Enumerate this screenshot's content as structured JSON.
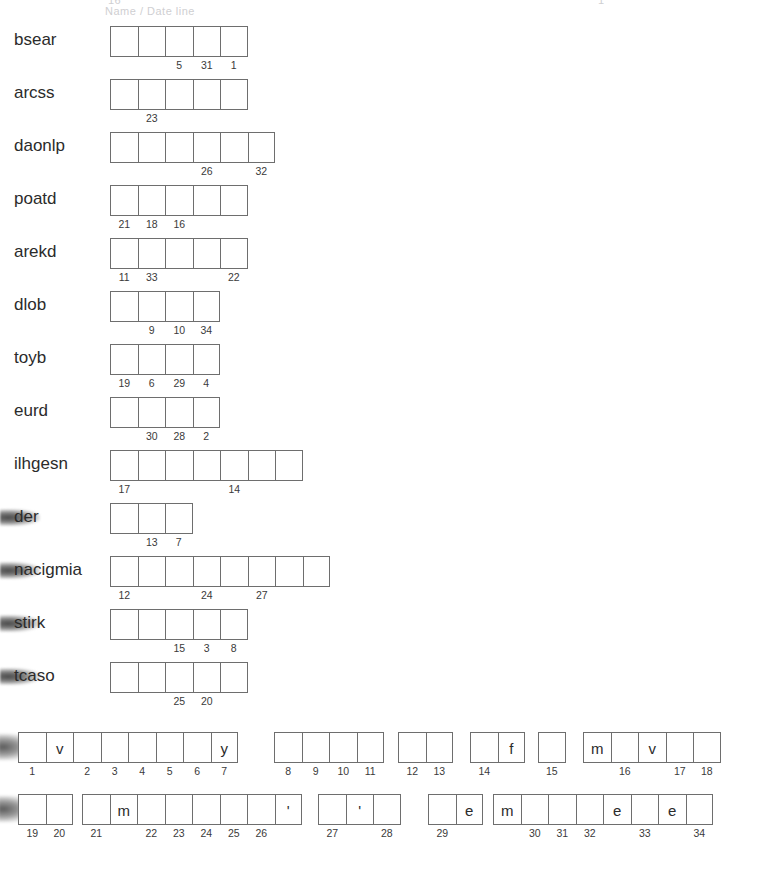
{
  "page": {
    "title_ghost_left": "16",
    "title_ghost_right": "1",
    "title_ghost_sub": "Name / Date line"
  },
  "scramble": {
    "rows": [
      {
        "label": "bsear",
        "cells": 5,
        "numbers": {
          "2": "5",
          "3": "31",
          "4": "1"
        }
      },
      {
        "label": "arcss",
        "cells": 5,
        "numbers": {
          "1": "23"
        }
      },
      {
        "label": "daonlp",
        "cells": 6,
        "numbers": {
          "3": "26",
          "5": "32"
        }
      },
      {
        "label": "poatd",
        "cells": 5,
        "numbers": {
          "0": "21",
          "1": "18",
          "2": "16"
        }
      },
      {
        "label": "arekd",
        "cells": 5,
        "numbers": {
          "0": "11",
          "1": "33",
          "4": "22"
        }
      },
      {
        "label": "dlob",
        "cells": 4,
        "numbers": {
          "1": "9",
          "2": "10",
          "3": "34"
        }
      },
      {
        "label": "toyb",
        "cells": 4,
        "numbers": {
          "0": "19",
          "1": "6",
          "2": "29",
          "3": "4"
        }
      },
      {
        "label": "eurd",
        "cells": 4,
        "numbers": {
          "1": "30",
          "2": "28",
          "3": "2"
        }
      },
      {
        "label": "ilhgesn",
        "cells": 7,
        "numbers": {
          "0": "17",
          "4": "14"
        }
      },
      {
        "label": "der",
        "cells": 3,
        "numbers": {
          "1": "13",
          "2": "7"
        },
        "smudge": true
      },
      {
        "label": "nacigmia",
        "cells": 8,
        "numbers": {
          "0": "12",
          "3": "24",
          "5": "27"
        },
        "smudge": true
      },
      {
        "label": "stirk",
        "cells": 5,
        "numbers": {
          "2": "15",
          "3": "3",
          "4": "8"
        },
        "smudge": true
      },
      {
        "label": "tcaso",
        "cells": 5,
        "numbers": {
          "2": "25",
          "3": "20"
        },
        "smudge": true
      }
    ]
  },
  "cryptogram": {
    "rows": [
      {
        "smudge": true,
        "words": [
          {
            "left": 18,
            "cells": [
              {
                "letter": "",
                "num": "1"
              },
              {
                "letter": "v",
                "num": ""
              },
              {
                "letter": "",
                "num": "2"
              },
              {
                "letter": "",
                "num": "3"
              },
              {
                "letter": "",
                "num": "4"
              },
              {
                "letter": "",
                "num": "5"
              },
              {
                "letter": "",
                "num": "6"
              },
              {
                "letter": "y",
                "num": "7"
              }
            ]
          },
          {
            "left": 274,
            "cells": [
              {
                "letter": "",
                "num": "8"
              },
              {
                "letter": "",
                "num": "9"
              },
              {
                "letter": "",
                "num": "10"
              },
              {
                "letter": "",
                "num": "11"
              }
            ]
          },
          {
            "left": 398,
            "cells": [
              {
                "letter": "",
                "num": "12"
              },
              {
                "letter": "",
                "num": "13"
              }
            ]
          },
          {
            "left": 470,
            "cells": [
              {
                "letter": "",
                "num": "14"
              },
              {
                "letter": "f",
                "num": ""
              }
            ]
          },
          {
            "left": 538,
            "cells": [
              {
                "letter": "",
                "num": "15"
              }
            ]
          },
          {
            "left": 583,
            "cells": [
              {
                "letter": "m",
                "num": ""
              },
              {
                "letter": "",
                "num": "16"
              },
              {
                "letter": "v",
                "num": ""
              },
              {
                "letter": "",
                "num": "17"
              },
              {
                "letter": "",
                "num": "18"
              }
            ]
          }
        ]
      },
      {
        "smudge": true,
        "words": [
          {
            "left": 18,
            "cells": [
              {
                "letter": "",
                "num": "19"
              },
              {
                "letter": "",
                "num": "20"
              }
            ]
          },
          {
            "left": 82,
            "cells": [
              {
                "letter": "",
                "num": "21"
              },
              {
                "letter": "m",
                "num": ""
              },
              {
                "letter": "",
                "num": "22"
              },
              {
                "letter": "",
                "num": "23"
              },
              {
                "letter": "",
                "num": "24"
              },
              {
                "letter": "",
                "num": "25"
              },
              {
                "letter": "",
                "num": "26"
              },
              {
                "letter": "'",
                "num": ""
              }
            ]
          },
          {
            "left": 318,
            "cells": [
              {
                "letter": "",
                "num": "27"
              },
              {
                "letter": "'",
                "num": ""
              },
              {
                "letter": "",
                "num": "28"
              }
            ]
          },
          {
            "left": 428,
            "cells": [
              {
                "letter": "",
                "num": "29"
              },
              {
                "letter": "e",
                "num": ""
              }
            ]
          },
          {
            "left": 493,
            "cells": [
              {
                "letter": "m",
                "num": ""
              },
              {
                "letter": "",
                "num": "30"
              },
              {
                "letter": "",
                "num": "31"
              },
              {
                "letter": "",
                "num": "32"
              },
              {
                "letter": "e",
                "num": ""
              },
              {
                "letter": "",
                "num": "33"
              },
              {
                "letter": "e",
                "num": ""
              },
              {
                "letter": "",
                "num": "34"
              }
            ]
          }
        ]
      }
    ]
  }
}
